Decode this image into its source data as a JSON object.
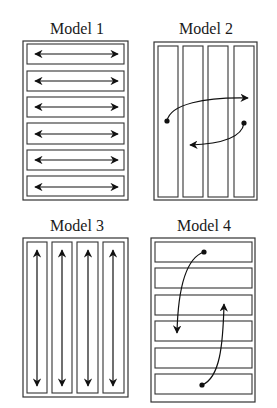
{
  "diagram": {
    "panels": [
      {
        "id": "model-1",
        "title": "Model 1",
        "layout": "horizontal-bands",
        "band_count": 6,
        "motion": "bidirectional horizontal arrows within each band"
      },
      {
        "id": "model-2",
        "title": "Model 2",
        "layout": "vertical-columns",
        "band_count": 4,
        "motion": "curved arrows jumping across columns (left-to-right upper, right-to-left lower)"
      },
      {
        "id": "model-3",
        "title": "Model 3",
        "layout": "vertical-columns",
        "band_count": 4,
        "motion": "bidirectional vertical arrows within each column"
      },
      {
        "id": "model-4",
        "title": "Model 4",
        "layout": "horizontal-bands",
        "band_count": 6,
        "motion": "curved arrows jumping across bands (downward and upward)"
      }
    ],
    "colors": {
      "line": "#333333",
      "arrow": "#111111",
      "background": "#ffffff"
    }
  }
}
